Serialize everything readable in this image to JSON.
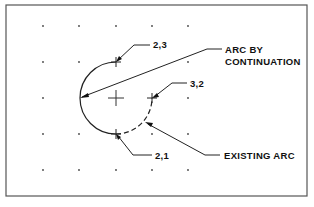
{
  "diagram": {
    "type": "cad-arc-construction",
    "grid": {
      "columns_x": [
        43,
        79,
        116,
        152,
        188
      ],
      "rows_y": [
        26,
        62,
        98,
        134,
        170
      ],
      "spacing_px": 36
    },
    "center_mark": {
      "x": 116,
      "y": 98
    },
    "points": [
      {
        "id": "p23",
        "label": "2,3",
        "x": 116,
        "y": 62
      },
      {
        "id": "p32",
        "label": "3,2",
        "x": 152,
        "y": 98
      },
      {
        "id": "p21",
        "label": "2,1",
        "x": 116,
        "y": 134
      }
    ],
    "arcs": [
      {
        "name": "arc-by-continuation",
        "style": "solid",
        "from": "2,3",
        "through": "left",
        "to": "2,1",
        "radius_px": 36
      },
      {
        "name": "existing-arc",
        "style": "dashed",
        "from": "2,1",
        "to": "3,2",
        "radius_px": 36
      }
    ]
  },
  "labels": {
    "p23": "2,3",
    "p32": "3,2",
    "p21": "2,1",
    "arc_by_line1": "ARC  BY",
    "arc_by_line2": "CONTINUATION",
    "existing_arc": "EXISTING  ARC"
  }
}
